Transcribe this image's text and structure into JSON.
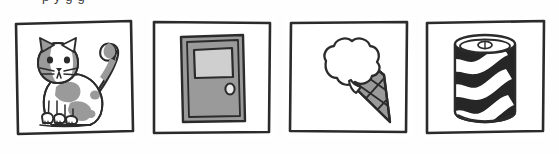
{
  "sheet": {
    "background_color": "#fefefe",
    "caption_clipped_text": "only partial descenders of a worksheet instruction line are visible",
    "panel_count": 4
  },
  "caption": {
    "text": "p y g g"
  },
  "palette": {
    "ink": "#2b2b2b",
    "paper": "#ffffff",
    "gray_mid": "#9a9a9a",
    "gray_light": "#cfcfcf",
    "gray_dark": "#707070",
    "near_black": "#262626"
  },
  "panels": [
    {
      "id": "cat",
      "label": "cat",
      "icon_name": "cat-drawing",
      "description": "Hand-drawn seated cat facing forward with gray and white patches, pointed ears, whiskers, and a curled upright tail",
      "fills": {
        "body": "#ffffff",
        "patches": "#9a9a9a",
        "outline": "#2b2b2b"
      }
    },
    {
      "id": "door",
      "label": "door",
      "icon_name": "door-drawing",
      "description": "Hand-drawn rectangular door with a lighter window pane in the upper half and a round doorknob on the right",
      "fills": {
        "door": "#9a9a9a",
        "window": "#cfcfcf",
        "knob": "#e8e8e8",
        "outline": "#2b2b2b"
      }
    },
    {
      "id": "icecream",
      "label": "ice cream cone",
      "icon_name": "ice-cream-cone-drawing",
      "description": "Hand-drawn ice cream cone tilted diagonally, a cloud-shaped white scoop on the upper left and a gray waffle cone with diamond crosshatch pointing to the lower right",
      "fills": {
        "scoop": "#ffffff",
        "cone": "#9a9a9a",
        "outline": "#2b2b2b"
      }
    },
    {
      "id": "can",
      "label": "can",
      "icon_name": "soda-can-drawing",
      "description": "Hand-drawn cylindrical beverage can with an elliptical top and pull-tab ring, dark body with white wavy diagonal stripes",
      "fills": {
        "body": "#262626",
        "stripes": "#ffffff",
        "top": "#ffffff",
        "outline": "#2b2b2b"
      }
    }
  ]
}
